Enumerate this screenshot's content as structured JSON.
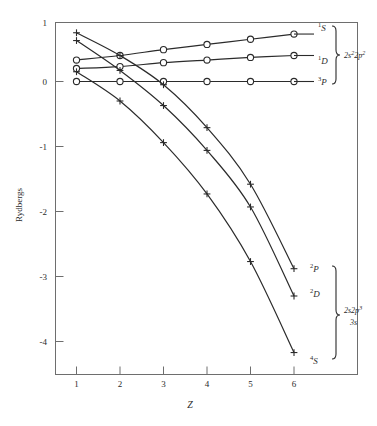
{
  "figure": {
    "background_color": "#ffffff",
    "line_color": "#2b2b2b",
    "axis_color": "#6e6e6e"
  },
  "axes": {
    "x_title": "Z",
    "y_title": "Rydbergs",
    "x_ticks": [
      "1",
      "2",
      "3",
      "4",
      "5",
      "6"
    ],
    "y_ticks": [
      "1",
      "0",
      "-1",
      "-2",
      "-3",
      "-4"
    ]
  },
  "groups": [
    {
      "id": "upper",
      "label_line1": "2s",
      "label_sup1": "2",
      "label_line2": "2p",
      "label_sup2": "2",
      "label_line3": "",
      "label_full": "2s²2p²"
    },
    {
      "id": "lower",
      "label_line1": "2s2p",
      "label_sup1": "3",
      "label_line2": "3s",
      "label_full": "2s2p³ 3s"
    }
  ],
  "series_labels": [
    {
      "id": "1S",
      "pre": "1",
      "letter": "S"
    },
    {
      "id": "1D",
      "pre": "1",
      "letter": "D"
    },
    {
      "id": "3P",
      "pre": "3",
      "letter": "P"
    },
    {
      "id": "2P",
      "pre": "2",
      "letter": "P"
    },
    {
      "id": "2D",
      "pre": "2",
      "letter": "D"
    },
    {
      "id": "4S",
      "pre": "4",
      "letter": "S"
    }
  ],
  "chart_data": {
    "type": "line",
    "title": "",
    "xlabel": "Z",
    "ylabel": "Rydbergs",
    "xlim": [
      0.6,
      6.9
    ],
    "ylim": [
      -4.45,
      0.95
    ],
    "grid": false,
    "legend": "right-inline",
    "x": [
      1,
      2,
      3,
      4,
      5,
      6
    ],
    "series": [
      {
        "name": "1S",
        "label": "¹S",
        "group": "2s²2p²",
        "marker": "circle",
        "values": [
          0.33,
          0.4,
          0.49,
          0.57,
          0.65,
          0.73
        ]
      },
      {
        "name": "1D",
        "label": "¹D",
        "group": "2s²2p²",
        "marker": "circle",
        "values": [
          0.2,
          0.23,
          0.29,
          0.33,
          0.37,
          0.4
        ]
      },
      {
        "name": "3P",
        "label": "³P",
        "group": "2s²2p²",
        "marker": "circle",
        "values": [
          0.0,
          0.0,
          0.0,
          0.0,
          0.0,
          0.0
        ]
      },
      {
        "name": "2P",
        "label": "²P",
        "group": "2s2p³3s",
        "marker": "plus",
        "values": [
          0.75,
          0.4,
          -0.05,
          -0.71,
          -1.58,
          -2.88
        ]
      },
      {
        "name": "2D",
        "label": "²D",
        "group": "2s2p³3s",
        "marker": "plus",
        "values": [
          0.63,
          0.17,
          -0.37,
          -1.06,
          -1.93,
          -3.3
        ]
      },
      {
        "name": "4S",
        "label": "⁴S",
        "group": "2s2p³3s",
        "marker": "plus",
        "values": [
          0.15,
          -0.3,
          -0.94,
          -1.73,
          -2.77,
          -4.17
        ]
      }
    ]
  }
}
